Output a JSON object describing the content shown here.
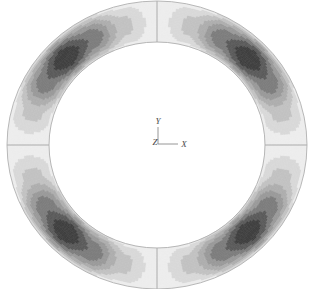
{
  "figure": {
    "type": "fea-contour-plot",
    "background_color": "#ffffff",
    "geometry": {
      "shape": "annulus",
      "center_x": 157,
      "center_y": 145,
      "outer_radius_x": 150,
      "outer_radius_y": 144,
      "inner_radius_x": 108,
      "inner_radius_y": 103,
      "hole_fill": "#ffffff",
      "outline_color": "#b0b0b0"
    },
    "symmetry": {
      "fold": 4,
      "lobe_angles_deg": [
        45,
        135,
        225,
        315
      ]
    }
  },
  "axis_triad": {
    "name": "coordinate-axis-triad",
    "origin_x": 158,
    "origin_y": 144,
    "arm_length": 17,
    "line_color": "#8a8a8a",
    "labels": {
      "y": "Y",
      "x": "X",
      "z": "Z"
    }
  },
  "contour_bands": [
    {
      "level": 1,
      "label": "band-1",
      "color": "#ededed",
      "role": "lowest"
    },
    {
      "level": 2,
      "label": "band-2",
      "color": "#d8d8d8",
      "role": "low"
    },
    {
      "level": 3,
      "label": "band-3",
      "color": "#c2c2c2",
      "role": "low-mid"
    },
    {
      "level": 4,
      "label": "band-4",
      "color": "#aeaeae",
      "role": "mid"
    },
    {
      "level": 5,
      "label": "band-5",
      "color": "#9a9a9a",
      "role": "mid-high"
    },
    {
      "level": 6,
      "label": "band-6",
      "color": "#7d7d7d",
      "role": "high"
    },
    {
      "level": 7,
      "label": "band-7",
      "color": "#5a5a5a",
      "role": "very-high"
    },
    {
      "level": 8,
      "label": "band-8",
      "color": "#3f3f3f",
      "role": "peak"
    }
  ],
  "mesh_seams": {
    "color": "#9c9c9c",
    "angles_deg": [
      0,
      90,
      180,
      270
    ]
  },
  "chart_data": {
    "type": "heatmap",
    "title": "",
    "xlabel": "X",
    "ylabel": "Y",
    "angular_samples_deg": [
      0,
      15,
      30,
      45,
      60,
      75,
      90,
      105,
      120,
      135,
      150,
      165,
      180,
      195,
      210,
      225,
      240,
      255,
      270,
      285,
      300,
      315,
      330,
      345
    ],
    "values": [
      0.05,
      0.3,
      0.72,
      1.0,
      0.72,
      0.3,
      0.05,
      0.3,
      0.72,
      1.0,
      0.72,
      0.3,
      0.05,
      0.3,
      0.72,
      1.0,
      0.72,
      0.3,
      0.05,
      0.3,
      0.72,
      1.0,
      0.72,
      0.3
    ],
    "radial_profile_note": "Within each lobe the contour peaks near the mid-thickness of the ring and decays toward both the inner and outer edges.",
    "value_range": [
      0,
      1
    ],
    "grid": false,
    "legend": "none"
  }
}
